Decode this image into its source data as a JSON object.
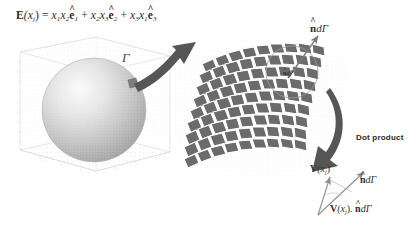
{
  "figure": {
    "equation": {
      "lhs_bold": "E",
      "lhs_arg": "(x",
      "lhs_sub": "j",
      "lhs_close": ")",
      "equals": "=",
      "term1_coef": "x",
      "term1_sub1": "1",
      "term1_coef2": "x",
      "term1_sub2": "2",
      "term1_basis": "e",
      "term1_basis_sub": "1",
      "plus1": "+",
      "term2_coef": "x",
      "term2_sub1": "2",
      "term2_coef2": "x",
      "term2_sub2": "3",
      "term2_basis": "e",
      "term2_basis_sub": "2",
      "plus2": "+",
      "term3_coef": "x",
      "term3_sub1": "3",
      "term3_coef2": "x",
      "term3_sub2": "1",
      "term3_basis": "e",
      "term3_basis_sub": "3",
      "hat_symbol": "^"
    },
    "labels": {
      "gamma": "Γ",
      "n_dgamma_top_hat": "n",
      "n_dgamma_top_rest": "dΓ",
      "n_dgamma_circle_hat": "n",
      "n_dgamma_circle_rest": "dΓ",
      "dot_product": "Dot product",
      "v_field_bold": "V",
      "v_field_arg": "(x",
      "v_field_sub": "j",
      "v_field_close": ")",
      "n_dgamma_right_hat": "n",
      "n_dgamma_right_rest": "dΓ",
      "dot_result_bold": "V",
      "dot_result_arg": "(x",
      "dot_result_sub": "j",
      "dot_result_close": ").",
      "dot_result_hat": "n",
      "dot_result_rest": "dΓ"
    },
    "colors": {
      "background": "#ffffff",
      "mesh_patch": "#6b6b6b",
      "mesh_line": "#ffffff",
      "arrow_dark": "#545454",
      "sphere_light": "#f2f2f2",
      "sphere_mid": "#c9c9c9",
      "sphere_dark": "#9a9a9a",
      "grid_faint": "#dcdcdc",
      "text": "#2e2e2e",
      "vector_line": "#8a8a8a"
    },
    "elements": {
      "sphere_plot": "3d-sphere-in-wireframe-box",
      "surface_mesh": "curved-quadrilateral-mesh-patch",
      "highlight_circle": "circle-zoom-highlight",
      "arrow_sphere_to_mesh": "curved-arrow-right",
      "arrow_mesh_to_vectors": "curved-arrow-down-left",
      "normal_arrow": "normal-vector-arrow",
      "vector_triangle": "vector-dot-product-triangle"
    },
    "mesh": {
      "rows": 9,
      "cols": 9
    }
  }
}
